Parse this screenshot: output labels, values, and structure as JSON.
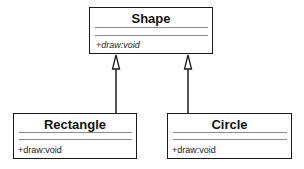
{
  "diagram": {
    "type": "uml-class-diagram",
    "classes": [
      {
        "id": "shape",
        "name": "Shape",
        "operations": [
          "+draw:void"
        ],
        "abstract": true
      },
      {
        "id": "rectangle",
        "name": "Rectangle",
        "operations": [
          "+draw:void"
        ],
        "abstract": false
      },
      {
        "id": "circle",
        "name": "Circle",
        "operations": [
          "+draw:void"
        ],
        "abstract": false
      }
    ],
    "relations": [
      {
        "type": "generalization",
        "from": "rectangle",
        "to": "shape"
      },
      {
        "type": "generalization",
        "from": "circle",
        "to": "shape"
      }
    ]
  }
}
